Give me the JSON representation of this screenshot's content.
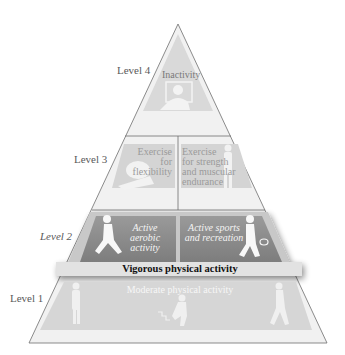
{
  "diagram": {
    "levels": [
      {
        "id": 4,
        "label": "Level 4",
        "sections": [
          {
            "text": "Inactivity",
            "figure": "person-at-computer"
          }
        ]
      },
      {
        "id": 3,
        "label": "Level 3",
        "sections": [
          {
            "text_lines": [
              "Exercise for",
              "flexibility"
            ],
            "figure": "stretching-person"
          },
          {
            "text_lines": [
              "Exercise",
              "for strength",
              "and muscular",
              "endurance"
            ],
            "figure": "standing-person"
          }
        ]
      },
      {
        "id": 2,
        "label": "Level 2",
        "sections": [
          {
            "text_lines": [
              "Active",
              "aerobic activity"
            ],
            "figure": "running-woman"
          },
          {
            "text_lines": [
              "Active sports",
              "and recreation"
            ],
            "figure": "tennis-player"
          }
        ],
        "band": "Vigorous physical activity"
      },
      {
        "id": 1,
        "label": "Level 1",
        "sections": [
          {
            "text": "Moderate physical activity",
            "figures": [
              "golfer",
              "stair-climber",
              "walker"
            ]
          }
        ]
      }
    ],
    "colors": {
      "outline": "#6e6e6e",
      "level4_fill": "#d9d9d9",
      "level3_fill": "#d4d4d4",
      "level2_fill": "#8f8f8f",
      "level2_frame": "#c6c6c6",
      "vigorous_band": "#e2e2e2",
      "level1_fill": "#d6d6d6",
      "pale_fill": "#ececec"
    }
  }
}
